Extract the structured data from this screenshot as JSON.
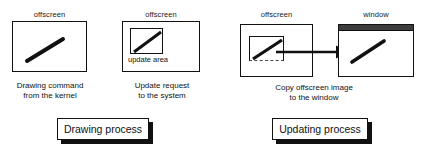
{
  "diagram": {
    "colors": {
      "ink": "#111111",
      "background": "#ffffff",
      "titlebar": "#3d3d3d",
      "dashed": "#4a4a4a"
    },
    "panels": [
      {
        "id": "drawing-process",
        "tag_label": "Drawing process",
        "figures": [
          {
            "id": "offscreen-drawing",
            "top_label": "offscreen",
            "caption": "Drawing command\nfrom the kernel",
            "surface": "offscreen",
            "has_inner_box": false,
            "inner_label": "",
            "stroke": "diagonal-line"
          },
          {
            "id": "offscreen-update-request",
            "top_label": "offscreen",
            "caption": "Update request\nto the system",
            "surface": "offscreen",
            "has_inner_box": true,
            "inner_label": "update area",
            "stroke": "diagonal-line"
          }
        ]
      },
      {
        "id": "updating-process",
        "tag_label": "Updating process",
        "caption": "Copy offscreen image\nto the window",
        "figures": [
          {
            "id": "offscreen-source",
            "top_label": "offscreen",
            "surface": "offscreen",
            "has_inner_box": true,
            "inner_box_style": "dashed-bottom",
            "inner_label": "",
            "stroke": "diagonal-line"
          },
          {
            "id": "window-destination",
            "top_label": "window",
            "surface": "window",
            "has_title_bar": true,
            "has_inner_box": false,
            "inner_label": "",
            "stroke": "diagonal-line"
          }
        ],
        "arrow": {
          "id": "copy-arrow",
          "direction": "right",
          "label": ""
        }
      }
    ]
  }
}
